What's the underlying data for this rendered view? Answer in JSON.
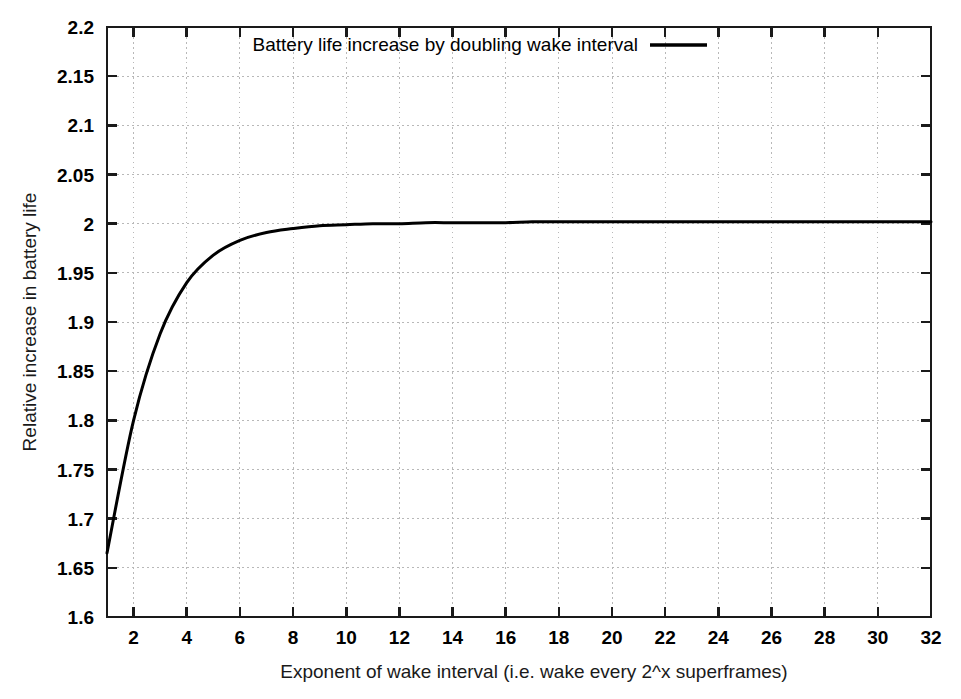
{
  "chart_data": {
    "type": "line",
    "title": "",
    "xlabel": "Exponent of wake interval (i.e. wake every 2^x superframes)",
    "ylabel": "Relative increase in battery life",
    "xlim": [
      1,
      32
    ],
    "ylim": [
      1.6,
      2.2
    ],
    "grid": true,
    "legend_position": "top-center-inside",
    "x_ticks": [
      2,
      4,
      6,
      8,
      10,
      12,
      14,
      16,
      18,
      20,
      22,
      24,
      26,
      28,
      30,
      32
    ],
    "x_tick_labels": [
      "2",
      "4",
      "6",
      "8",
      "10",
      "12",
      "14",
      "16",
      "18",
      "20",
      "22",
      "24",
      "26",
      "28",
      "30",
      "32"
    ],
    "y_ticks": [
      1.6,
      1.65,
      1.7,
      1.75,
      1.8,
      1.85,
      1.9,
      1.95,
      2.0,
      2.05,
      2.1,
      2.15,
      2.2
    ],
    "y_tick_labels": [
      "1.6",
      "1.65",
      "1.7",
      "1.75",
      "1.8",
      "1.85",
      "1.9",
      "1.95",
      "2",
      "2.05",
      "2.1",
      "2.15",
      "2.2"
    ],
    "series": [
      {
        "name": "Battery life increase by doubling wake interval",
        "color": "#000000",
        "line_width": 3,
        "x": [
          1,
          2,
          3,
          4,
          5,
          6,
          7,
          8,
          9,
          10,
          11,
          12,
          13,
          14,
          15,
          16,
          17,
          18,
          19,
          20,
          21,
          22,
          23,
          24,
          25,
          26,
          27,
          28,
          29,
          30,
          31,
          32
        ],
        "values": [
          1.665,
          1.8,
          1.888,
          1.94,
          1.968,
          1.983,
          1.991,
          1.995,
          1.998,
          1.999,
          2.0,
          2.0,
          2.001,
          2.001,
          2.001,
          2.001,
          2.002,
          2.002,
          2.002,
          2.002,
          2.002,
          2.002,
          2.002,
          2.002,
          2.002,
          2.002,
          2.002,
          2.002,
          2.002,
          2.002,
          2.002,
          2.002
        ]
      }
    ]
  },
  "legend": {
    "entries": [
      {
        "label": "Battery life increase by doubling wake interval",
        "color": "#000000"
      }
    ]
  },
  "axes": {
    "x_title": "Exponent of wake interval (i.e. wake every 2^x superframes)",
    "y_title": "Relative increase in battery life"
  },
  "colors": {
    "line": "#000000",
    "axis": "#1a1a1a",
    "grid": "#b8b8b8",
    "background": "#ffffff"
  }
}
